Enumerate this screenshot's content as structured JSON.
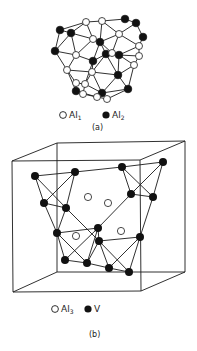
{
  "colors": {
    "line": "#1a1a1a",
    "filled": "#111111",
    "open": "#ffffff",
    "background": "#ffffff"
  },
  "panel_a": {
    "caption": "(a)",
    "legend": [
      {
        "symbol": "open-circle",
        "label": "Al",
        "subscript": "1"
      },
      {
        "symbol": "filled-circle",
        "label": "Al",
        "subscript": "2"
      }
    ],
    "nodes": [
      {
        "id": 0,
        "x": 86,
        "y": 22,
        "type": "open"
      },
      {
        "id": 1,
        "x": 102,
        "y": 21,
        "type": "open"
      },
      {
        "id": 2,
        "x": 125,
        "y": 19,
        "type": "filled"
      },
      {
        "id": 3,
        "x": 136,
        "y": 23,
        "type": "filled"
      },
      {
        "id": 4,
        "x": 60,
        "y": 30,
        "type": "filled"
      },
      {
        "id": 5,
        "x": 71,
        "y": 33,
        "type": "filled"
      },
      {
        "id": 6,
        "x": 119,
        "y": 34,
        "type": "open"
      },
      {
        "id": 7,
        "x": 143,
        "y": 37,
        "type": "filled"
      },
      {
        "id": 8,
        "x": 93,
        "y": 39,
        "type": "open"
      },
      {
        "id": 9,
        "x": 100,
        "y": 42,
        "type": "filled"
      },
      {
        "id": 10,
        "x": 139,
        "y": 46,
        "type": "open"
      },
      {
        "id": 11,
        "x": 55,
        "y": 51,
        "type": "filled"
      },
      {
        "id": 12,
        "x": 76,
        "y": 55,
        "type": "open"
      },
      {
        "id": 13,
        "x": 106,
        "y": 54,
        "type": "filled"
      },
      {
        "id": 14,
        "x": 112,
        "y": 53,
        "type": "open"
      },
      {
        "id": 15,
        "x": 119,
        "y": 55,
        "type": "filled"
      },
      {
        "id": 16,
        "x": 139,
        "y": 56,
        "type": "open"
      },
      {
        "id": 17,
        "x": 93,
        "y": 61,
        "type": "filled"
      },
      {
        "id": 18,
        "x": 134,
        "y": 65,
        "type": "open"
      },
      {
        "id": 19,
        "x": 67,
        "y": 70,
        "type": "open"
      },
      {
        "id": 20,
        "x": 92,
        "y": 72,
        "type": "open"
      },
      {
        "id": 21,
        "x": 118,
        "y": 75,
        "type": "filled"
      },
      {
        "id": 22,
        "x": 76,
        "y": 83,
        "type": "open"
      },
      {
        "id": 23,
        "x": 85,
        "y": 84,
        "type": "open"
      },
      {
        "id": 24,
        "x": 128,
        "y": 89,
        "type": "filled"
      },
      {
        "id": 25,
        "x": 76,
        "y": 91,
        "type": "filled"
      },
      {
        "id": 26,
        "x": 83,
        "y": 94,
        "type": "open"
      },
      {
        "id": 27,
        "x": 102,
        "y": 93,
        "type": "filled"
      },
      {
        "id": 28,
        "x": 97,
        "y": 97,
        "type": "open"
      },
      {
        "id": 29,
        "x": 107,
        "y": 99,
        "type": "open"
      }
    ],
    "edges": [
      [
        0,
        1
      ],
      [
        0,
        5
      ],
      [
        0,
        8
      ],
      [
        0,
        4
      ],
      [
        4,
        5
      ],
      [
        4,
        11
      ],
      [
        5,
        8
      ],
      [
        5,
        12
      ],
      [
        5,
        11
      ],
      [
        1,
        9
      ],
      [
        1,
        6
      ],
      [
        2,
        3
      ],
      [
        1,
        2
      ],
      [
        3,
        6
      ],
      [
        3,
        7
      ],
      [
        6,
        9
      ],
      [
        6,
        10
      ],
      [
        7,
        10
      ],
      [
        6,
        14
      ],
      [
        8,
        9
      ],
      [
        8,
        12
      ],
      [
        9,
        13
      ],
      [
        9,
        17
      ],
      [
        9,
        14
      ],
      [
        10,
        16
      ],
      [
        10,
        15
      ],
      [
        11,
        12
      ],
      [
        11,
        19
      ],
      [
        12,
        17
      ],
      [
        12,
        19
      ],
      [
        13,
        14
      ],
      [
        14,
        15
      ],
      [
        15,
        16
      ],
      [
        13,
        21
      ],
      [
        13,
        20
      ],
      [
        16,
        18
      ],
      [
        15,
        18
      ],
      [
        15,
        21
      ],
      [
        17,
        20
      ],
      [
        17,
        13
      ],
      [
        18,
        21
      ],
      [
        18,
        24
      ],
      [
        19,
        22
      ],
      [
        19,
        20
      ],
      [
        20,
        23
      ],
      [
        20,
        21
      ],
      [
        20,
        27
      ],
      [
        21,
        24
      ],
      [
        21,
        27
      ],
      [
        22,
        23
      ],
      [
        22,
        25
      ],
      [
        23,
        26
      ],
      [
        23,
        27
      ],
      [
        24,
        27
      ],
      [
        24,
        29
      ],
      [
        25,
        26
      ],
      [
        25,
        28
      ],
      [
        26,
        28
      ],
      [
        27,
        28
      ],
      [
        27,
        29
      ],
      [
        28,
        29
      ],
      [
        19,
        25
      ],
      [
        17,
        23
      ]
    ]
  },
  "panel_b": {
    "caption": "(b)",
    "legend": [
      {
        "symbol": "open-circle",
        "label": "Al",
        "subscript": "3"
      },
      {
        "symbol": "filled-circle",
        "label": "V",
        "subscript": ""
      }
    ],
    "cube": {
      "front": [
        [
          12,
          161
        ],
        [
          140,
          160
        ],
        [
          141,
          291
        ],
        [
          13,
          292
        ]
      ],
      "back": [
        [
          57,
          143
        ],
        [
          185,
          141
        ],
        [
          185,
          272
        ],
        [
          57,
          272
        ]
      ]
    },
    "v_atoms": [
      {
        "id": 0,
        "x": 35,
        "y": 176
      },
      {
        "id": 1,
        "x": 75,
        "y": 172
      },
      {
        "id": 2,
        "x": 44,
        "y": 203
      },
      {
        "id": 3,
        "x": 66,
        "y": 208
      },
      {
        "id": 4,
        "x": 122,
        "y": 167
      },
      {
        "id": 5,
        "x": 163,
        "y": 162
      },
      {
        "id": 6,
        "x": 131,
        "y": 194
      },
      {
        "id": 7,
        "x": 153,
        "y": 197
      },
      {
        "id": 8,
        "x": 57,
        "y": 233
      },
      {
        "id": 9,
        "x": 98,
        "y": 228
      },
      {
        "id": 10,
        "x": 99,
        "y": 241
      },
      {
        "id": 11,
        "x": 140,
        "y": 237
      },
      {
        "id": 12,
        "x": 65,
        "y": 260
      },
      {
        "id": 13,
        "x": 87,
        "y": 263
      },
      {
        "id": 14,
        "x": 109,
        "y": 268
      },
      {
        "id": 15,
        "x": 129,
        "y": 272
      }
    ],
    "al3_atoms": [
      {
        "x": 88,
        "y": 197
      },
      {
        "x": 108,
        "y": 203
      },
      {
        "x": 121,
        "y": 231
      },
      {
        "x": 76,
        "y": 236
      }
    ],
    "bonds": [
      [
        0,
        1
      ],
      [
        1,
        4
      ],
      [
        4,
        5
      ],
      [
        0,
        2
      ],
      [
        0,
        3
      ],
      [
        1,
        2
      ],
      [
        1,
        3
      ],
      [
        2,
        3
      ],
      [
        4,
        6
      ],
      [
        4,
        7
      ],
      [
        5,
        6
      ],
      [
        5,
        7
      ],
      [
        6,
        7
      ],
      [
        2,
        8
      ],
      [
        3,
        8
      ],
      [
        3,
        10
      ],
      [
        8,
        9
      ],
      [
        8,
        12
      ],
      [
        8,
        13
      ],
      [
        9,
        10
      ],
      [
        9,
        12
      ],
      [
        6,
        9
      ],
      [
        7,
        11
      ],
      [
        10,
        11
      ],
      [
        10,
        13
      ],
      [
        10,
        14
      ],
      [
        10,
        15
      ],
      [
        11,
        14
      ],
      [
        11,
        15
      ],
      [
        12,
        13
      ],
      [
        13,
        14
      ],
      [
        14,
        15
      ],
      [
        9,
        13
      ]
    ]
  }
}
